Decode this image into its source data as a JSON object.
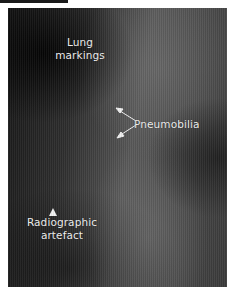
{
  "figure": {
    "type": "radiograph",
    "labels": {
      "lung_markings": "Lung\nmarkings",
      "lung_line1": "Lung",
      "lung_line2": "markings",
      "pneumobilia": "Pneumobilia",
      "artefact_line1": "Radiographic",
      "artefact_line2": "artefact"
    },
    "annotations": {
      "arrow_count_pneumobilia": 2,
      "arrowhead_artefact": true
    },
    "colors": {
      "label_text": "#f2f2f2",
      "frame_bg": "#ffffff"
    }
  }
}
